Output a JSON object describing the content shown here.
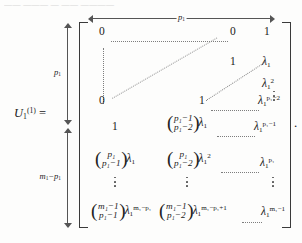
{
  "document": {
    "type": "mathematical-equation",
    "cutoff_line_above": "—— ——— — —— ————",
    "lhs": {
      "symbol": "U",
      "subscript": "1",
      "superscript": "(1)",
      "equals": "="
    },
    "trailing_punctuation": "."
  },
  "braces": {
    "top": {
      "label": "p",
      "label_sub": "1",
      "name": "column-count-brace"
    },
    "left_upper": {
      "label": "p",
      "label_sub": "1",
      "name": "row-block-1-brace"
    },
    "left_lower": {
      "label_main": "m",
      "label_main_sub": "1",
      "label_minus": "−",
      "label_second": "p",
      "label_second_sub": "1",
      "name": "row-block-2-brace"
    }
  },
  "matrix": {
    "rows": [
      {
        "id": "row-1",
        "cells": [
          {
            "kind": "num",
            "text": "0"
          },
          {
            "kind": "num",
            "text": "0"
          },
          {
            "kind": "num",
            "text": "1"
          }
        ]
      },
      {
        "id": "row-2",
        "cells": [
          {
            "kind": "num",
            "text": "1"
          },
          {
            "kind": "lambda",
            "base": "λ",
            "sub": "1",
            "sup": ""
          }
        ]
      },
      {
        "id": "row-3",
        "cells": [
          {
            "kind": "lambda",
            "base": "λ",
            "sub": "1",
            "sup": "2"
          }
        ]
      },
      {
        "id": "row-4",
        "cells": [
          {
            "kind": "num",
            "text": "0"
          },
          {
            "kind": "num",
            "text": "1"
          },
          {
            "kind": "lambda",
            "base": "λ",
            "sub": "1",
            "sup": "p₁−2"
          }
        ]
      },
      {
        "id": "row-5",
        "cells": [
          {
            "kind": "num",
            "text": "1"
          },
          {
            "kind": "binom-lambda",
            "top": "p₁−1",
            "bottom": "p₁−2",
            "lambda": "λ₁"
          },
          {
            "kind": "lambda",
            "base": "λ",
            "sub": "1",
            "sup": "p₁−1"
          }
        ]
      },
      {
        "id": "row-6",
        "cells": [
          {
            "kind": "binom-lambda",
            "top": "p₁",
            "bottom": "p₁−1",
            "lambda": "λ₁"
          },
          {
            "kind": "binom-lambda",
            "top": "p₁",
            "bottom": "p₁−2",
            "lambda": "λ₁²"
          },
          {
            "kind": "lambda",
            "base": "λ",
            "sub": "1",
            "sup": "p₁"
          }
        ]
      },
      {
        "id": "row-7",
        "cells": [
          {
            "kind": "binom-lambda",
            "top": "m₁−1",
            "bottom": "p₁−1",
            "lambda": "λ₁^(m₁−p₁)"
          },
          {
            "kind": "binom-lambda",
            "top": "m₁−1",
            "bottom": "p₁−2",
            "lambda": "λ₁^(m₁−p₁+1)"
          },
          {
            "kind": "lambda",
            "base": "λ",
            "sub": "1",
            "sup": "m₁−1"
          }
        ]
      }
    ],
    "entries": {
      "r1c1": "0",
      "r1c2": "0",
      "r1c3": "1",
      "r2c2": "1",
      "r4c1": "0",
      "r4c2": "1",
      "r5c1": "1",
      "lambda": "λ",
      "one": "1",
      "zero": "0",
      "ellipsis_dots": "⋯",
      "vertical_dots": "⋮"
    },
    "symbols": {
      "p1": "p",
      "p1sub": "1",
      "m1": "m",
      "m1sub": "1",
      "minus": "−",
      "plus": "+",
      "two": "2",
      "one": "1"
    },
    "exponents": {
      "e_2": "2",
      "e_p1_minus_2": "p₁−2",
      "e_p1_minus_1": "p₁−1",
      "e_p1": "p₁",
      "e_m1_minus_p1": "m₁−p₁",
      "e_m1_minus_p1_plus_1": "m₁−p₁+1",
      "e_m1_minus_1": "m₁−1"
    }
  },
  "colors": {
    "paper": "#fdfdfc",
    "ink": "#1a1a1a",
    "rule": "#555555",
    "dots": "#7d7d7d",
    "bracket": "#3a3a3a"
  }
}
